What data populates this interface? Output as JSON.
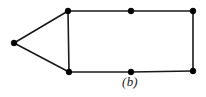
{
  "figure": {
    "caption": "(b)",
    "background_color": "#ffffff",
    "edge_color": "#1a1a1a",
    "vertex_color": "#000000",
    "caption_color": "#1a1a1a"
  },
  "chart_data": {
    "type": "diagram",
    "subtype": "undirected-graph",
    "title": "(b)",
    "xlabel": "",
    "ylabel": "",
    "xlim": [
      0,
      206
    ],
    "ylim": [
      0,
      97
    ],
    "grid": false,
    "legend": "none",
    "vertex_count": 7,
    "edge_count": 8,
    "vertex_radius": 2.9,
    "edge_width": 1.6,
    "nodes": [
      {
        "id": "apex",
        "label": "",
        "x": 14,
        "y": 43
      },
      {
        "id": "top-left",
        "label": "",
        "x": 68,
        "y": 11
      },
      {
        "id": "top-middle",
        "label": "",
        "x": 131,
        "y": 11
      },
      {
        "id": "top-right",
        "label": "",
        "x": 193,
        "y": 11
      },
      {
        "id": "bottom-right",
        "label": "",
        "x": 193,
        "y": 71
      },
      {
        "id": "bottom-middle",
        "label": "",
        "x": 131,
        "y": 72
      },
      {
        "id": "bottom-left",
        "label": "",
        "x": 69,
        "y": 72
      }
    ],
    "edges": [
      {
        "id": "edge-apex-topleft",
        "from": "apex",
        "to": "top-left"
      },
      {
        "id": "edge-apex-bottomleft",
        "from": "apex",
        "to": "bottom-left"
      },
      {
        "id": "edge-topleft-bottomleft",
        "from": "top-left",
        "to": "bottom-left"
      },
      {
        "id": "edge-topleft-topmiddle",
        "from": "top-left",
        "to": "top-middle"
      },
      {
        "id": "edge-topmiddle-topright",
        "from": "top-middle",
        "to": "top-right"
      },
      {
        "id": "edge-topright-bottomright",
        "from": "top-right",
        "to": "bottom-right"
      },
      {
        "id": "edge-bottomright-bottommiddle",
        "from": "bottom-right",
        "to": "bottom-middle"
      },
      {
        "id": "edge-bottommiddle-bottomleft",
        "from": "bottom-middle",
        "to": "bottom-left"
      }
    ]
  }
}
